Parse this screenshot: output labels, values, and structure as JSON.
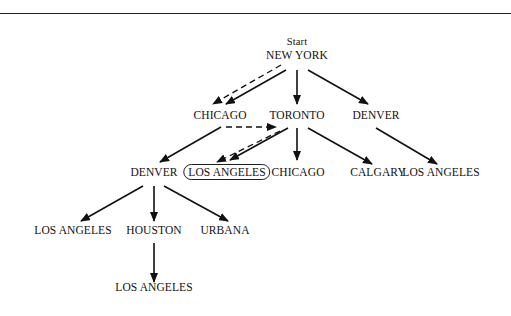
{
  "diagram": {
    "start_label": "Start",
    "nodes": {
      "root": "NEW YORK",
      "chicago1": "CHICAGO",
      "toronto": "TORONTO",
      "denver1": "DENVER",
      "denver2": "DENVER",
      "la_goal": "LOS ANGELES",
      "chicago2": "CHICAGO",
      "calgary": "CALGARY",
      "la_denver1": "LOS ANGELES",
      "la_denver2": "LOS ANGELES",
      "houston": "HOUSTON",
      "urbana": "URBANA",
      "la_houston": "LOS ANGELES"
    },
    "edges": [
      {
        "from": "NEW YORK",
        "to": "CHICAGO",
        "style": "solid"
      },
      {
        "from": "NEW YORK",
        "to": "TORONTO",
        "style": "solid"
      },
      {
        "from": "NEW YORK",
        "to": "DENVER",
        "style": "solid"
      },
      {
        "from": "TORONTO",
        "to": "DENVER",
        "style": "solid"
      },
      {
        "from": "TORONTO",
        "to": "LOS ANGELES",
        "style": "solid"
      },
      {
        "from": "TORONTO",
        "to": "CHICAGO",
        "style": "solid"
      },
      {
        "from": "TORONTO",
        "to": "CALGARY",
        "style": "solid"
      },
      {
        "from": "DENVER",
        "to": "LOS ANGELES",
        "style": "solid"
      },
      {
        "from": "DENVER",
        "to": "LOS ANGELES",
        "style": "solid"
      },
      {
        "from": "DENVER",
        "to": "HOUSTON",
        "style": "solid"
      },
      {
        "from": "DENVER",
        "to": "URBANA",
        "style": "solid"
      },
      {
        "from": "HOUSTON",
        "to": "LOS ANGELES",
        "style": "solid"
      }
    ],
    "search_path": [
      "NEW YORK",
      "CHICAGO",
      "TORONTO",
      "LOS ANGELES"
    ],
    "goal_node": "LOS ANGELES"
  }
}
